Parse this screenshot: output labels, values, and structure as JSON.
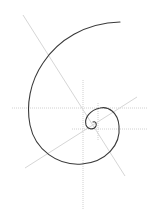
{
  "diagram": {
    "title": "",
    "colors": {
      "background": "#ffffff",
      "spiral": "#3a3a3a",
      "guides": "#d6d6d6"
    },
    "guides": [
      {
        "id": "horizontal-1",
        "x1": 12,
        "y1": 108,
        "x2": 148,
        "y2": 108,
        "style": "dotted"
      },
      {
        "id": "horizontal-2",
        "x1": 72,
        "y1": 129,
        "x2": 148,
        "y2": 129,
        "style": "dotted"
      },
      {
        "id": "vertical-1",
        "x1": 83,
        "y1": 80,
        "x2": 83,
        "y2": 210,
        "style": "dotted"
      },
      {
        "id": "vertical-2",
        "x1": 98,
        "y1": 103,
        "x2": 98,
        "y2": 140,
        "style": "dotted"
      },
      {
        "id": "diagonal-1",
        "x1": 23,
        "y1": 15,
        "x2": 125,
        "y2": 176,
        "style": "solid"
      },
      {
        "id": "diagonal-2",
        "x1": 25,
        "y1": 168,
        "x2": 137,
        "y2": 97,
        "style": "solid"
      }
    ],
    "spiral": {
      "type": "logarithmic",
      "path": "M120,22 C85,23 58,40 43,63 C30,82 26,105 30,125 C35,150 58,166 82,164 C106,162 121,145 119,126 C118,112 108,106 100,108 C90,110 84,118 86,125 C88,130 94,130 96,126 C97,123 95,121 93,122"
    }
  }
}
